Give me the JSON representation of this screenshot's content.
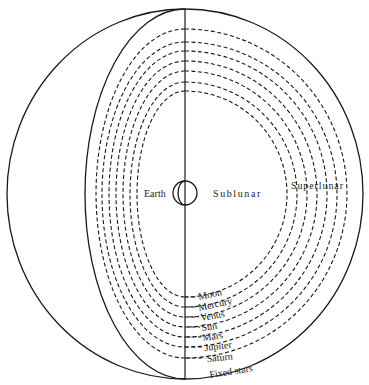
{
  "diagram": {
    "labels": {
      "earth": "Earth",
      "sublunar": "Sublunar",
      "superlunar": "Superlunar",
      "fixed_stars": "Fixed stars"
    },
    "spheres": [
      {
        "name": "Moon"
      },
      {
        "name": "Mercury"
      },
      {
        "name": "Venus"
      },
      {
        "name": "Sun"
      },
      {
        "name": "Mars"
      },
      {
        "name": "Jupiter"
      },
      {
        "name": "Saturn"
      }
    ],
    "colors": {
      "ink": "#1a1a1a",
      "background": "#ffffff"
    }
  }
}
